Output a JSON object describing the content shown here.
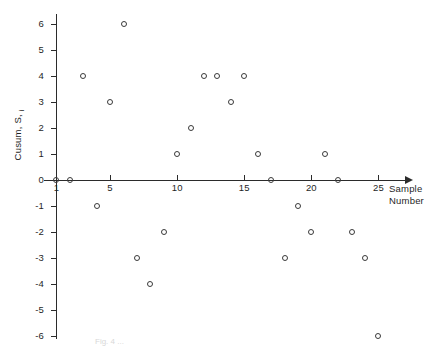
{
  "chart_data": {
    "type": "scatter",
    "title": "",
    "xlabel": "Sample Number",
    "ylabel": "Cusum, S",
    "ylabel_sub": "i",
    "xlim": [
      0,
      26.5
    ],
    "ylim": [
      -6.5,
      6.5
    ],
    "grid": false,
    "legend": null,
    "x_ticks": [
      5,
      10,
      15,
      20,
      25
    ],
    "x_tick_labels": [
      "5",
      "10",
      "15",
      "20",
      "25"
    ],
    "y_ticks": [
      6,
      5,
      4,
      3,
      2,
      1,
      0,
      -1,
      -2,
      -3,
      -4,
      -5,
      -6
    ],
    "y_tick_labels": [
      "6",
      "5",
      "4",
      "3",
      "2",
      "1",
      "0",
      "-1",
      "-2",
      "-3",
      "-4",
      "-5",
      "-6"
    ],
    "first_point_label": "1",
    "x": [
      1,
      2,
      3,
      4,
      5,
      6,
      7,
      8,
      9,
      10,
      11,
      12,
      13,
      14,
      15,
      16,
      17,
      18,
      19,
      20,
      21,
      22,
      23,
      24,
      25
    ],
    "values": [
      0,
      0,
      4,
      -1,
      3,
      6,
      -3,
      -4,
      -2,
      1,
      2,
      4,
      4,
      3,
      4,
      1,
      0,
      -3,
      -1,
      -2,
      1,
      0,
      -2,
      -3,
      -6
    ],
    "marker": "open-circle",
    "marker_color": "#3a3a3a",
    "axis_color": "#2b2b2b"
  },
  "caption": {
    "text": "Fig. 4 ..."
  }
}
